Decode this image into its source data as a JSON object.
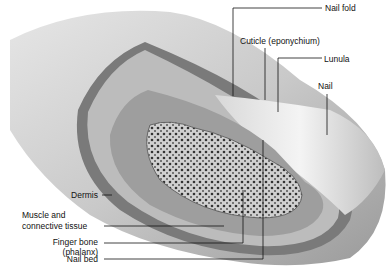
{
  "labels": {
    "nail_fold": "Nail fold",
    "cuticle": "Cuticle (eponychium)",
    "lunula": "Lunula",
    "nail": "Nail",
    "dermis": "Dermis",
    "muscle_line1": "Muscle and",
    "muscle_line2": "connective tissue",
    "bone_line1": "Finger bone",
    "bone_line2": "(phalanx)",
    "nail_bed": "Nail bed"
  }
}
